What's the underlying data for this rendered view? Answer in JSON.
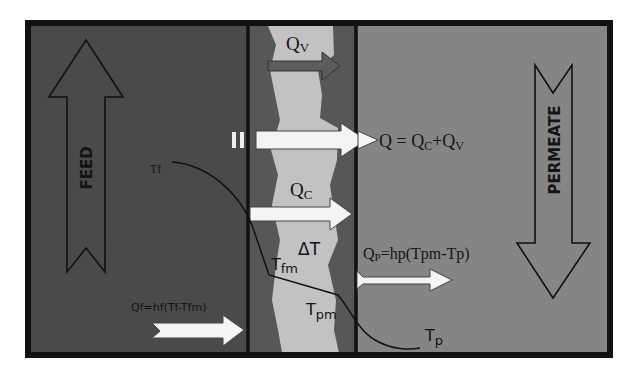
{
  "colors": {
    "background": "#ffffff",
    "frame": "#111111",
    "feed_side": "#4a4a4a",
    "membrane_dark": "#575757",
    "pore_light": "#c2c2c2",
    "permeate_side": "#858585",
    "vapor_arrow": "#5c5c5c",
    "heat_arrow": "#f4f4f4",
    "text": "#141414"
  },
  "labels": {
    "feed": "FEED",
    "permeate": "PERMEATE",
    "qv_main": "Q",
    "qv_sub": "V",
    "qc_main": "Q",
    "qc_sub": "C",
    "q_total_eq": "Q = Q",
    "q_total_sub_c": "C",
    "q_total_plus": "+Q",
    "q_total_sub_v": "V",
    "tf": "Tf",
    "tfm_main": "T",
    "tfm_sub": "fm",
    "delta_t": "ΔT",
    "tpm_main": "T",
    "tpm_sub": "pm",
    "tp_main": "T",
    "tp_sub": "p",
    "qp_eq_main": "Q",
    "qp_eq_sub": "P",
    "qp_eq_rest": "=hp(Tpm-Tp)",
    "qf_eq": "Qf=hf(Tf-Tfm)"
  }
}
